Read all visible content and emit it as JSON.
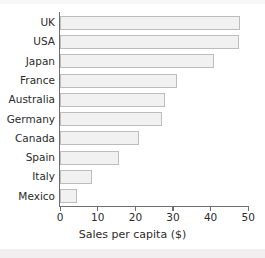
{
  "chart_data": {
    "type": "bar",
    "orientation": "horizontal",
    "title": "",
    "xlabel": "Sales per capita ($)",
    "ylabel": "",
    "xlim": [
      0,
      50
    ],
    "grid": false,
    "legend": null,
    "xticks": [
      "0",
      "10",
      "20",
      "30",
      "40",
      "50"
    ],
    "xtick_values": [
      0,
      10,
      20,
      30,
      40,
      50
    ],
    "categories": [
      "UK",
      "USA",
      "Japan",
      "France",
      "Australia",
      "Germany",
      "Canada",
      "Spain",
      "Italy",
      "Mexico"
    ],
    "values": [
      48,
      47.5,
      41,
      31,
      28,
      27,
      21,
      15.7,
      8.5,
      4.5
    ],
    "bars": [
      {
        "category": "UK",
        "value": 48
      },
      {
        "category": "USA",
        "value": 47.5
      },
      {
        "category": "Japan",
        "value": 41
      },
      {
        "category": "France",
        "value": 31
      },
      {
        "category": "Australia",
        "value": 28
      },
      {
        "category": "Germany",
        "value": 27
      },
      {
        "category": "Canada",
        "value": 21
      },
      {
        "category": "Spain",
        "value": 15.7
      },
      {
        "category": "Italy",
        "value": 8.5
      },
      {
        "category": "Mexico",
        "value": 4.5
      }
    ],
    "colors": {
      "bar_fill": "#f1f1f1",
      "bar_stroke": "#bdbdbd",
      "axis": "#6e6e6e",
      "text": "#2b2b2b",
      "background": "#ffffff"
    }
  }
}
